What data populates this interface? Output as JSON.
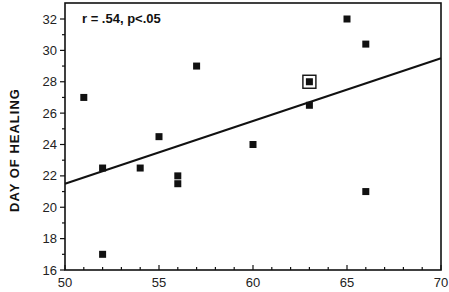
{
  "chart_data": {
    "type": "scatter",
    "title": "",
    "xlabel": "",
    "ylabel": "DAY OF HEALING",
    "xlim": [
      50,
      70
    ],
    "ylim": [
      16,
      32
    ],
    "x_ticks": [
      50,
      55,
      60,
      65,
      70
    ],
    "y_ticks": [
      16,
      18,
      20,
      22,
      24,
      26,
      28,
      30,
      32
    ],
    "x_minor_step": 1,
    "y_minor_step": 1,
    "grid": false,
    "legend": null,
    "annotation": "r = .54,  p<.05",
    "series": [
      {
        "name": "observations",
        "marker": "filled-square",
        "points": [
          {
            "x": 51,
            "y": 27
          },
          {
            "x": 52,
            "y": 22.5
          },
          {
            "x": 52,
            "y": 17
          },
          {
            "x": 54,
            "y": 22.5
          },
          {
            "x": 55,
            "y": 24.5
          },
          {
            "x": 56,
            "y": 22
          },
          {
            "x": 56,
            "y": 21.5
          },
          {
            "x": 57,
            "y": 29
          },
          {
            "x": 60,
            "y": 24
          },
          {
            "x": 63,
            "y": 28,
            "highlighted": true
          },
          {
            "x": 63,
            "y": 26.5
          },
          {
            "x": 65,
            "y": 32
          },
          {
            "x": 66,
            "y": 30.4
          },
          {
            "x": 66,
            "y": 21
          }
        ]
      }
    ],
    "regression_line": {
      "x": [
        50,
        70
      ],
      "y": [
        21.5,
        29.5
      ]
    }
  }
}
